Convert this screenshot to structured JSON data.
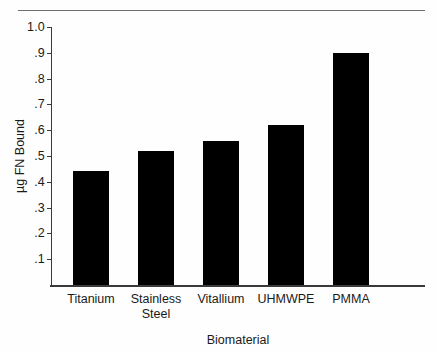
{
  "figure": {
    "top_rule_color": "#6e6e6e",
    "axis_color": "#3a3a3a",
    "background": "#ffffff"
  },
  "chart_data": {
    "type": "bar",
    "title": "",
    "subtitle": "",
    "xlabel": "Biomaterial",
    "ylabel": "µg FN Bound",
    "categories": [
      "Titanium",
      "Stainless\nSteel",
      "Vitallium",
      "UHMWPE",
      "PMMA"
    ],
    "category_labels": [
      {
        "line1": "Titanium",
        "line2": ""
      },
      {
        "line1": "Stainless",
        "line2": "Steel"
      },
      {
        "line1": "Vitallium",
        "line2": ""
      },
      {
        "line1": "UHMWPE",
        "line2": ""
      },
      {
        "line1": "PMMA",
        "line2": ""
      }
    ],
    "values": [
      0.44,
      0.52,
      0.56,
      0.62,
      0.9
    ],
    "ylim": [
      0,
      1.0
    ],
    "ytick_values": [
      1.0,
      0.9,
      0.8,
      0.7,
      0.6,
      0.5,
      0.4,
      0.3,
      0.2,
      0.1
    ],
    "ytick_labels": [
      "1.0",
      ".9",
      ".8",
      ".7",
      ".6",
      ".5",
      ".4",
      ".3",
      ".2",
      ".1"
    ],
    "bar_color": "#000000",
    "grid": false,
    "legend": null,
    "legend_position": "none",
    "annotations": []
  }
}
